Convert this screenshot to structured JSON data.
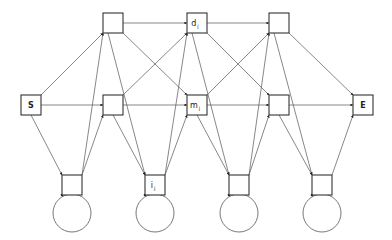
{
  "diagram": {
    "type": "profile-hmm",
    "colors": {
      "stroke": "#333333",
      "edge": "#555555",
      "background": "#ffffff"
    },
    "nodes": {
      "start": {
        "id": "S",
        "label": "S",
        "x": 21,
        "y": 95
      },
      "end": {
        "id": "E",
        "label": "E",
        "x": 353,
        "y": 95
      },
      "delete": [
        {
          "id": "d1",
          "label": "",
          "sub": "",
          "x": 103,
          "y": 13
        },
        {
          "id": "dj",
          "label": "d",
          "sub": "j",
          "x": 187,
          "y": 13
        },
        {
          "id": "d3",
          "label": "",
          "sub": "",
          "x": 269,
          "y": 13
        }
      ],
      "match": [
        {
          "id": "m1",
          "label": "",
          "sub": "",
          "x": 103,
          "y": 95
        },
        {
          "id": "mj",
          "label": "m",
          "sub": "j",
          "x": 187,
          "y": 95
        },
        {
          "id": "m3",
          "label": "",
          "sub": "",
          "x": 269,
          "y": 95
        }
      ],
      "insert": [
        {
          "id": "i0",
          "label": "",
          "sub": "",
          "x": 62,
          "y": 175
        },
        {
          "id": "ij",
          "label": "i",
          "sub": "j",
          "x": 145,
          "y": 175
        },
        {
          "id": "i2",
          "label": "",
          "sub": "",
          "x": 229,
          "y": 175
        },
        {
          "id": "i3",
          "label": "",
          "sub": "",
          "x": 312,
          "y": 175
        }
      ]
    },
    "box_size": 20,
    "self_loop_radius": 19
  }
}
